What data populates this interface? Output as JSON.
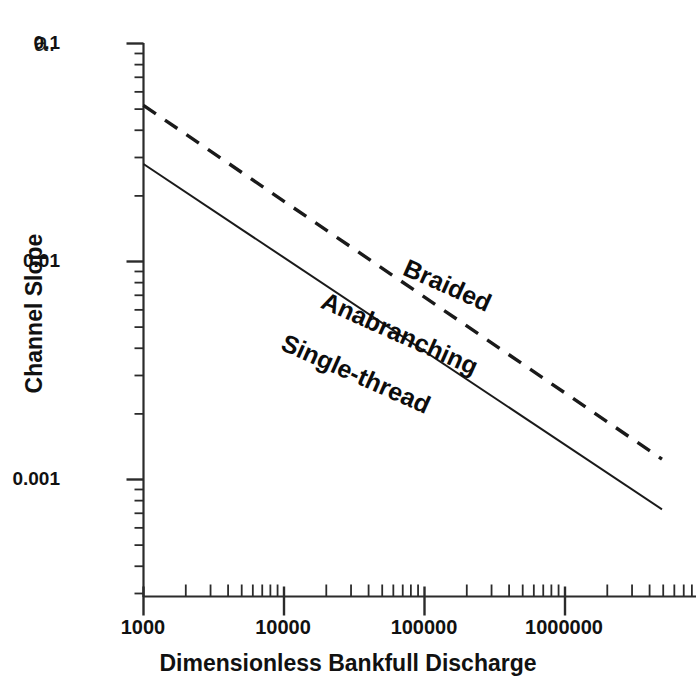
{
  "figure": {
    "panel_label": "a.",
    "background_color": "#ffffff",
    "line_color": "#1a1a1a"
  },
  "chart_data": {
    "type": "line",
    "title": "",
    "subtitle": "",
    "xlabel": "Dimensionless Bankfull Discharge",
    "ylabel": "Channel Slope",
    "xscale": "log",
    "yscale": "log",
    "xlim": [
      1000,
      5000000
    ],
    "ylim": [
      0.0005,
      0.1
    ],
    "grid": false,
    "legend_position": "inline-annotations",
    "xticks": [
      1000,
      10000,
      100000,
      1000000
    ],
    "xtick_labels": [
      "1000",
      "10000",
      "100000",
      "1000000"
    ],
    "yticks": [
      0.1,
      0.01,
      0.001
    ],
    "ytick_labels": [
      "0.1",
      "0.01",
      "0.001"
    ],
    "minor_ticks": true,
    "series": [
      {
        "name": "Braided threshold",
        "style": "dashed",
        "x": [
          1000,
          4900000
        ],
        "y": [
          0.052,
          0.00124
        ],
        "slope_exponent": -0.55
      },
      {
        "name": "Single-thread threshold",
        "style": "solid",
        "x": [
          1000,
          4900000
        ],
        "y": [
          0.028,
          0.00073
        ],
        "slope_exponent": -0.55
      }
    ],
    "annotations": [
      {
        "text": "Braided",
        "x": 130000,
        "y": 0.0082,
        "rotation_deg": 24
      },
      {
        "text": "Anabranching",
        "x": 52000,
        "y": 0.0059,
        "rotation_deg": 24
      },
      {
        "text": "Single-thread",
        "x": 33000,
        "y": 0.0038,
        "rotation_deg": 24
      }
    ]
  },
  "axes": {
    "y_tick_labels": [
      {
        "text": "0.1",
        "top": 32,
        "right": 60
      },
      {
        "text": "0.01",
        "top": 250,
        "right": 60
      },
      {
        "text": "0.001",
        "top": 468,
        "right": 60
      }
    ],
    "x_tick_labels": [
      {
        "text": "1000",
        "left": 143
      },
      {
        "text": "10000",
        "left": 283
      },
      {
        "text": "100000",
        "left": 424
      },
      {
        "text": "1000000",
        "left": 564
      }
    ]
  },
  "region_labels": [
    {
      "text": "Braided",
      "left": 405,
      "top": 252,
      "rotation_deg": 24
    },
    {
      "text": "Anabranching",
      "left": 323,
      "top": 285,
      "rotation_deg": 24
    },
    {
      "text": "Single-thread",
      "left": 283,
      "top": 327,
      "rotation_deg": 24
    }
  ]
}
